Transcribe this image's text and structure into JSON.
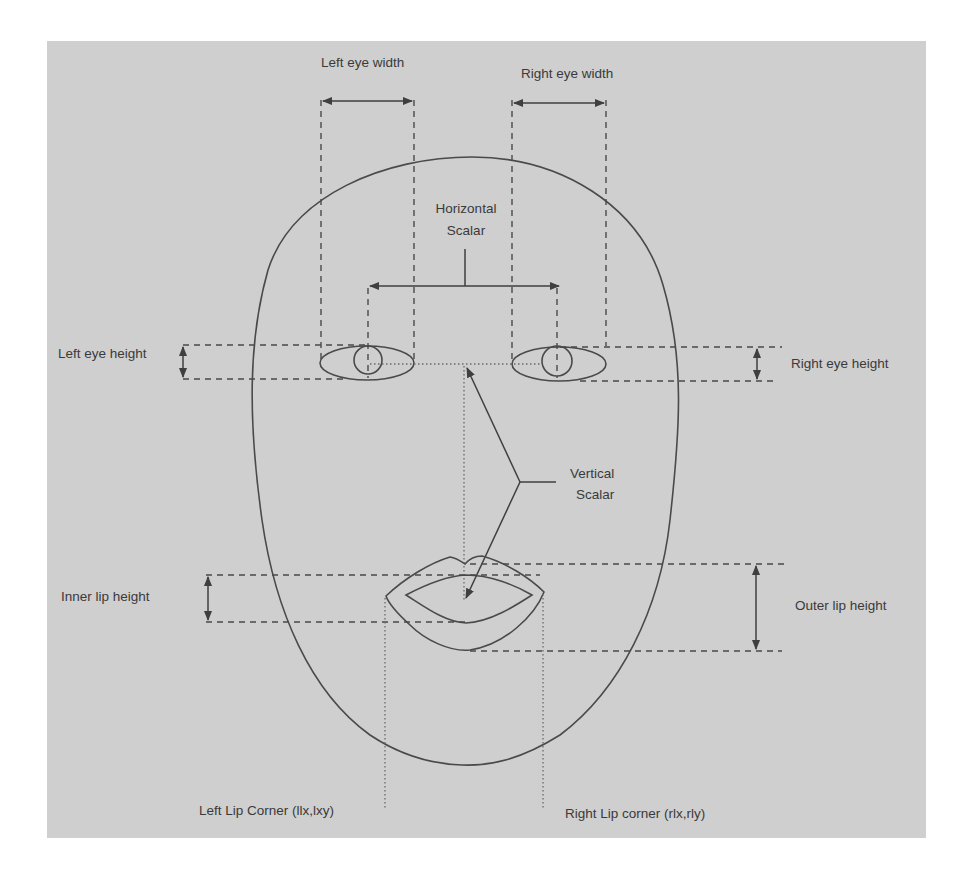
{
  "diagram": {
    "type": "face-feature-annotation",
    "background_color": "#cfcfcf",
    "line_color": "#4a4a4a",
    "labels": {
      "left_eye_width": "Left eye width",
      "right_eye_width": "Right eye width",
      "horizontal_scalar_line1": "Horizontal",
      "horizontal_scalar_line2": "Scalar",
      "left_eye_height": "Left eye height",
      "right_eye_height": "Right eye height",
      "vertical_scalar_line1": "Vertical",
      "vertical_scalar_line2": "Scalar",
      "inner_lip_height": "Inner lip height",
      "outer_lip_height": "Outer lip height",
      "left_lip_corner": "Left Lip Corner (llx,lxy)",
      "right_lip_corner": "Right Lip corner (rlx,rly)"
    },
    "nodes": [
      {
        "id": "face-outline",
        "shape": "oval"
      },
      {
        "id": "left-eye",
        "shape": "ellipse-with-pupil"
      },
      {
        "id": "right-eye",
        "shape": "ellipse-with-pupil"
      },
      {
        "id": "mouth",
        "shape": "outer-and-inner-lips"
      }
    ],
    "measurements": [
      {
        "label": "Left eye width",
        "kind": "horizontal-double-arrow"
      },
      {
        "label": "Right eye width",
        "kind": "horizontal-double-arrow"
      },
      {
        "label": "Horizontal Scalar",
        "kind": "distance between pupils"
      },
      {
        "label": "Left eye height",
        "kind": "vertical-double-arrow"
      },
      {
        "label": "Right eye height",
        "kind": "vertical-double-arrow"
      },
      {
        "label": "Vertical Scalar",
        "kind": "eye line to mouth center"
      },
      {
        "label": "Inner lip height",
        "kind": "vertical-double-arrow"
      },
      {
        "label": "Outer lip height",
        "kind": "vertical-double-arrow"
      },
      {
        "label": "Left Lip Corner (llx,lxy)",
        "kind": "dotted reference line"
      },
      {
        "label": "Right Lip corner (rlx,rly)",
        "kind": "dotted reference line"
      }
    ]
  }
}
